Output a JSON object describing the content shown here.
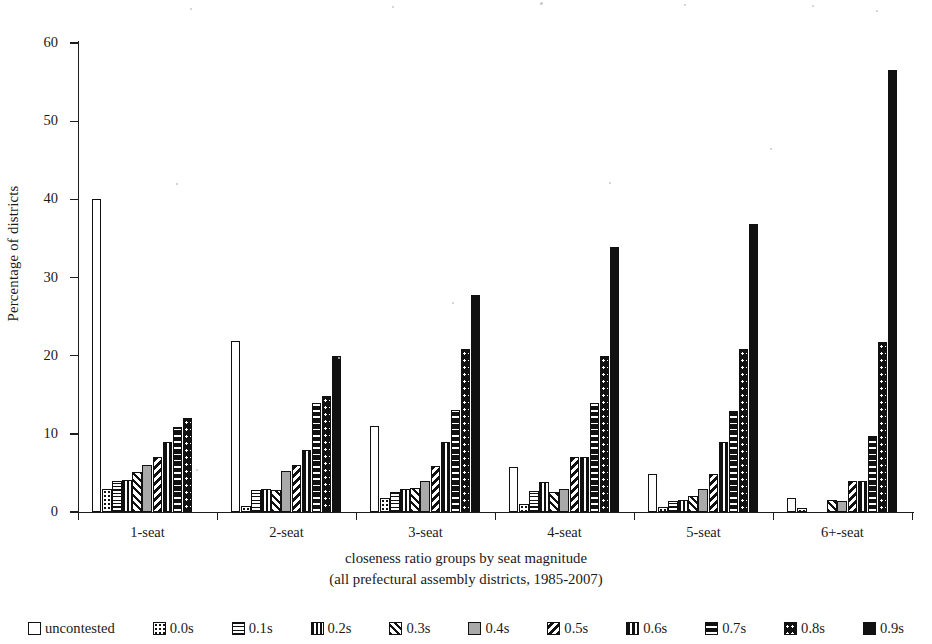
{
  "chart_data": {
    "type": "bar",
    "title": "",
    "xlabel": "closeness ratio groups by seat magnitude",
    "xlabel_sub": "(all prefectural assembly districts, 1985-2007)",
    "ylabel": "Percentage of districts",
    "ylim": [
      0,
      60
    ],
    "yticks": [
      0,
      10,
      20,
      30,
      40,
      50,
      60
    ],
    "grid": false,
    "legend_position": "bottom",
    "categories": [
      "1-seat",
      "2-seat",
      "3-seat",
      "4-seat",
      "5-seat",
      "6+-seat"
    ],
    "series": [
      {
        "name": "uncontested",
        "pattern": "uncontested",
        "values": [
          40.0,
          21.9,
          11.0,
          5.8,
          4.8,
          1.8
        ]
      },
      {
        "name": "0.0s",
        "pattern": "00s",
        "values": [
          2.9,
          0.8,
          1.8,
          1.0,
          0.6,
          0.5
        ]
      },
      {
        "name": "0.1s",
        "pattern": "01s",
        "values": [
          4.0,
          2.8,
          2.5,
          2.7,
          1.4,
          0.0
        ]
      },
      {
        "name": "0.2s",
        "pattern": "02s",
        "values": [
          4.1,
          2.9,
          2.9,
          3.8,
          1.5,
          0.0
        ]
      },
      {
        "name": "0.3s",
        "pattern": "03s",
        "values": [
          5.1,
          2.8,
          3.1,
          2.6,
          2.0,
          1.6
        ]
      },
      {
        "name": "0.4s",
        "pattern": "04s",
        "values": [
          6.0,
          5.2,
          4.0,
          3.0,
          3.0,
          1.4
        ]
      },
      {
        "name": "0.5s",
        "pattern": "05s",
        "values": [
          7.0,
          6.0,
          5.9,
          7.0,
          4.9,
          4.0
        ]
      },
      {
        "name": "0.6s",
        "pattern": "06s",
        "values": [
          9.0,
          7.9,
          9.0,
          7.1,
          8.9,
          4.0
        ]
      },
      {
        "name": "0.7s",
        "pattern": "07s",
        "values": [
          10.9,
          14.0,
          13.0,
          13.9,
          12.9,
          9.7
        ]
      },
      {
        "name": "0.8s",
        "pattern": "08s",
        "values": [
          12.0,
          14.9,
          20.9,
          19.9,
          20.9,
          21.8
        ]
      },
      {
        "name": "0.9s",
        "pattern": "09s",
        "values": [
          0.0,
          19.9,
          27.8,
          33.9,
          36.8,
          56.5
        ]
      }
    ]
  },
  "legend": {
    "items": [
      {
        "label": "uncontested",
        "pattern": "uncontested"
      },
      {
        "label": "0.0s",
        "pattern": "00s"
      },
      {
        "label": "0.1s",
        "pattern": "01s"
      },
      {
        "label": "0.2s",
        "pattern": "02s"
      },
      {
        "label": "0.3s",
        "pattern": "03s"
      },
      {
        "label": "0.4s",
        "pattern": "04s"
      },
      {
        "label": "0.5s",
        "pattern": "05s"
      },
      {
        "label": "0.6s",
        "pattern": "06s"
      },
      {
        "label": "0.7s",
        "pattern": "07s"
      },
      {
        "label": "0.8s",
        "pattern": "08s"
      },
      {
        "label": "0.9s",
        "pattern": "09s"
      }
    ]
  },
  "colors": {
    "ink": "#111111",
    "grey_fill": "#a9a9a9",
    "background": "#ffffff"
  }
}
